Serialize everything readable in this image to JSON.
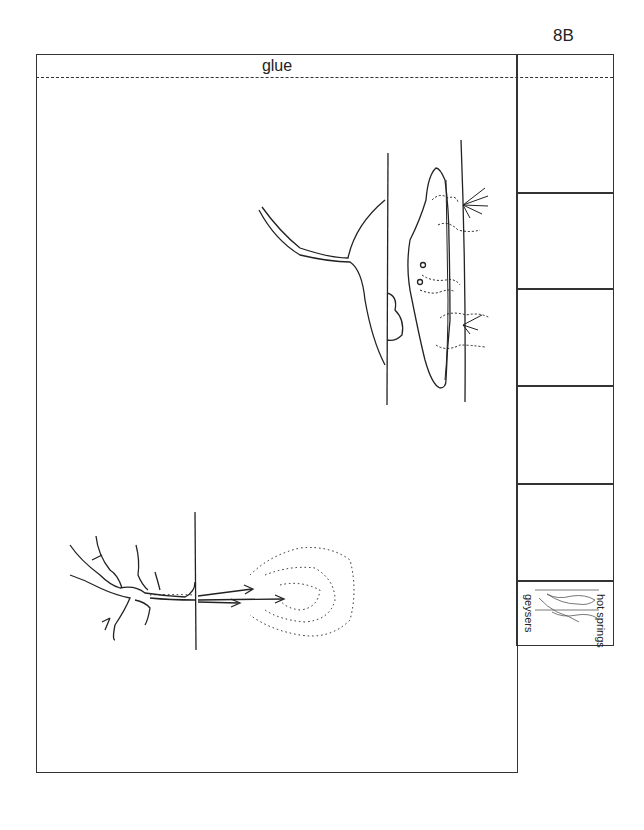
{
  "page": {
    "id_label": "8B",
    "glue_label": "glue"
  },
  "strip": {
    "cells": [
      {
        "label": ""
      },
      {
        "label": ""
      },
      {
        "label": ""
      },
      {
        "label": ""
      },
      {
        "label": ""
      },
      {
        "label": "",
        "thumbnail_labels": {
          "top": "hot springs",
          "bottom": "geysers"
        }
      }
    ]
  },
  "figures": [
    {
      "name": "hot-springs-diagram",
      "description": "cross-section with magma chamber and rising water"
    },
    {
      "name": "geyser-diagram",
      "description": "branching channels with erupting spray and arrows"
    }
  ]
}
